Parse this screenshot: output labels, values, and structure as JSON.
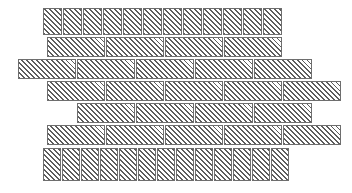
{
  "figure": {
    "type": "masonry-bond-pattern-diagram",
    "title": "",
    "background_color": "#ffffff",
    "brick_fill_color": "#ffffff",
    "brick_hatch_color": "#5d5d5d",
    "brick_border_color": "#6e6e6e",
    "hatch_angle_degrees": 45,
    "hatch_spacing_px": 3.5,
    "canvas": {
      "width": 352,
      "height": 193
    }
  },
  "courses": [
    {
      "index": 0,
      "name": "header-course-top",
      "brick_type": "header",
      "count": 12,
      "y": 8,
      "height": 27,
      "bricks": [
        {
          "x": 43,
          "width": 19
        },
        {
          "x": 63,
          "width": 19
        },
        {
          "x": 83,
          "width": 19
        },
        {
          "x": 103,
          "width": 19
        },
        {
          "x": 123,
          "width": 19
        },
        {
          "x": 143,
          "width": 19
        },
        {
          "x": 163,
          "width": 19
        },
        {
          "x": 183,
          "width": 19
        },
        {
          "x": 203,
          "width": 19
        },
        {
          "x": 223,
          "width": 19
        },
        {
          "x": 243,
          "width": 19
        },
        {
          "x": 263,
          "width": 19
        }
      ]
    },
    {
      "index": 1,
      "name": "stretcher-course-1",
      "brick_type": "stretcher",
      "count": 4,
      "y": 37,
      "height": 20,
      "bricks": [
        {
          "x": 47,
          "width": 58
        },
        {
          "x": 106,
          "width": 58
        },
        {
          "x": 165,
          "width": 58
        },
        {
          "x": 224,
          "width": 58
        }
      ]
    },
    {
      "index": 2,
      "name": "stretcher-course-2",
      "brick_type": "stretcher",
      "count": 5,
      "y": 59,
      "height": 20,
      "bricks": [
        {
          "x": 18,
          "width": 58
        },
        {
          "x": 77,
          "width": 58
        },
        {
          "x": 136,
          "width": 58
        },
        {
          "x": 195,
          "width": 58
        },
        {
          "x": 254,
          "width": 58
        }
      ]
    },
    {
      "index": 3,
      "name": "stretcher-course-3",
      "brick_type": "stretcher",
      "count": 5,
      "y": 81,
      "height": 20,
      "bricks": [
        {
          "x": 47,
          "width": 58
        },
        {
          "x": 106,
          "width": 58
        },
        {
          "x": 165,
          "width": 58
        },
        {
          "x": 224,
          "width": 58
        },
        {
          "x": 283,
          "width": 58
        }
      ]
    },
    {
      "index": 4,
      "name": "stretcher-course-4",
      "brick_type": "stretcher",
      "count": 4,
      "y": 103,
      "height": 20,
      "bricks": [
        {
          "x": 77,
          "width": 58
        },
        {
          "x": 136,
          "width": 58
        },
        {
          "x": 195,
          "width": 58
        },
        {
          "x": 254,
          "width": 58
        }
      ]
    },
    {
      "index": 5,
      "name": "stretcher-course-5",
      "brick_type": "stretcher",
      "count": 5,
      "y": 125,
      "height": 20,
      "bricks": [
        {
          "x": 47,
          "width": 58
        },
        {
          "x": 106,
          "width": 58
        },
        {
          "x": 165,
          "width": 58
        },
        {
          "x": 224,
          "width": 58
        },
        {
          "x": 283,
          "width": 58
        }
      ]
    },
    {
      "index": 6,
      "name": "header-course-bottom",
      "brick_type": "header",
      "count": 13,
      "y": 148,
      "height": 33,
      "bricks": [
        {
          "x": 43,
          "width": 18
        },
        {
          "x": 62,
          "width": 18
        },
        {
          "x": 81,
          "width": 18
        },
        {
          "x": 100,
          "width": 18
        },
        {
          "x": 119,
          "width": 18
        },
        {
          "x": 138,
          "width": 18
        },
        {
          "x": 157,
          "width": 18
        },
        {
          "x": 176,
          "width": 18
        },
        {
          "x": 195,
          "width": 18
        },
        {
          "x": 214,
          "width": 18
        },
        {
          "x": 233,
          "width": 18
        },
        {
          "x": 252,
          "width": 18
        },
        {
          "x": 271,
          "width": 18
        }
      ]
    }
  ]
}
